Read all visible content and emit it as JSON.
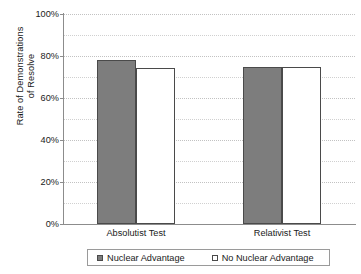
{
  "chart_data": {
    "type": "bar",
    "title": "",
    "subtitle": "",
    "xlabel": "",
    "ylabel_line1": "Rate of Demonstrations",
    "ylabel_line2": "of Resolve",
    "categories": [
      "Absolutist Test",
      "Relativist Test"
    ],
    "series": [
      {
        "name": "Nuclear Advantage",
        "values": [
          78,
          75
        ],
        "fill": "#7d7d7d",
        "border": "#4a4a4a",
        "swatch": "filled"
      },
      {
        "name": "No Nuclear Advantage",
        "values": [
          74.5,
          75
        ],
        "fill": "#ffffff",
        "border": "#4a4a4a",
        "swatch": "open"
      }
    ],
    "ylim": [
      0,
      100
    ],
    "y_ticks": [
      0,
      20,
      40,
      60,
      80,
      100
    ],
    "y_tick_labels": [
      "0%",
      "20%",
      "40%",
      "60%",
      "80%",
      "100%"
    ],
    "y_minor_ticks": [
      10,
      30,
      50,
      70,
      90
    ],
    "grid": true,
    "grid_color": "#c2c2c2",
    "legend_position": "bottom",
    "axis_color": "#8c8c8c",
    "text_color": "#1a1a1a",
    "background": "#ffffff"
  }
}
